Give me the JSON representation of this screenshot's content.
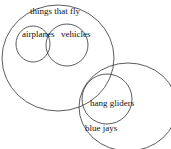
{
  "diagram": {
    "type": "venn",
    "sets": [
      {
        "id": "fly",
        "label": "things that fly"
      },
      {
        "id": "airplanes",
        "label": "airplanes"
      },
      {
        "id": "vehicles",
        "label": "vehicles"
      },
      {
        "id": "hang_gliders",
        "label": "hang gliders"
      },
      {
        "id": "blue_jays",
        "label": "blue jays"
      }
    ],
    "stroke_color": "#333333"
  }
}
